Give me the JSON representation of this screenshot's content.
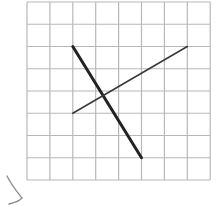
{
  "diagram": {
    "type": "grid-with-line-segments",
    "grid": {
      "columns": 8,
      "rows": 8,
      "origin_px": [
        27,
        2
      ],
      "cell_w": 22.9,
      "cell_h": 22.25,
      "line_color": "#b8b8b8",
      "background": "#ffffff"
    },
    "segments": [
      {
        "name": "thick-segment",
        "from": [
          2,
          2
        ],
        "to": [
          5,
          7
        ],
        "color": "#222222",
        "width": 3
      },
      {
        "name": "thin-segment",
        "from": [
          2,
          5
        ],
        "to": [
          7,
          2
        ],
        "color": "#3a3a3a",
        "width": 1.6
      }
    ],
    "annotation_mark": {
      "name": "pencil-stroke",
      "color": "#777777"
    }
  }
}
